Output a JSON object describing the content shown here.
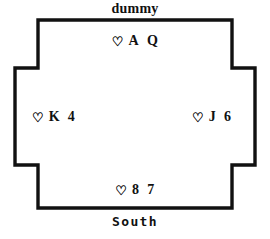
{
  "diagram": {
    "kind": "bridge-hand-diagram",
    "width": 270,
    "height": 239,
    "background_color": "#ffffff",
    "ink_color": "#111111",
    "border_width_px": 3
  },
  "labels": {
    "top": "dummy",
    "bottom": "South"
  },
  "hands": {
    "north": {
      "seat": "dummy",
      "suit_symbol": "♡",
      "suit_name": "hearts",
      "ranks": [
        "A",
        "Q"
      ],
      "text": "♡ A Q"
    },
    "west": {
      "seat": "West",
      "suit_symbol": "♡",
      "suit_name": "hearts",
      "ranks": [
        "K",
        "4"
      ],
      "text": "♡ K 4"
    },
    "east": {
      "seat": "East",
      "suit_symbol": "♡",
      "suit_name": "hearts",
      "ranks": [
        "J",
        "6"
      ],
      "text": "♡ J 6"
    },
    "south": {
      "seat": "South",
      "suit_symbol": "♡",
      "suit_name": "hearts",
      "ranks": [
        "8",
        "7"
      ],
      "text": "♡ 8 7"
    }
  }
}
